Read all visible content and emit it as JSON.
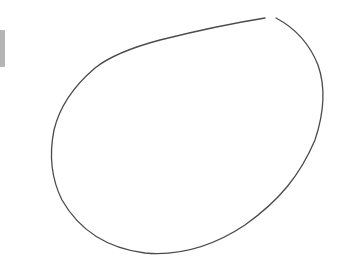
{
  "canvas": {
    "background": "#ffffff",
    "stroke_color": "#4a4a4a",
    "stroke_width": 1.3,
    "shape": "freehand-closed-loop"
  },
  "side_bar": {
    "color": "#b5b5b5"
  }
}
